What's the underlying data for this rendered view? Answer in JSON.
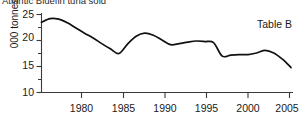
{
  "chart_data": {
    "type": "line",
    "title": "Atlantic Bluefin tuna sold",
    "xlabel": "",
    "ylabel": "000 tonnes",
    "annotation": "Table B",
    "grid": false,
    "legend": null,
    "xlim": [
      1976,
      2005
    ],
    "ylim": [
      10,
      25
    ],
    "x_ticks": [
      1980,
      1985,
      1990,
      1995,
      2000,
      2005
    ],
    "x_tick_labels": [
      "1980",
      "1985",
      "1990",
      "1995",
      "2000",
      "2005"
    ],
    "y_ticks": [
      10,
      15,
      20,
      25
    ],
    "y_tick_labels": [
      "10",
      "15",
      "20",
      "25"
    ],
    "y_minor_tick_step": 2.5,
    "line_color": "#111111",
    "series": [
      {
        "name": "Atlantic Bluefin tuna sold",
        "x": [
          1976,
          1977,
          1978,
          1979,
          1980,
          1981,
          1982,
          1983,
          1984,
          1985,
          1986,
          1987,
          1988,
          1989,
          1990,
          1991,
          1992,
          1993,
          1994,
          1995,
          1996,
          1997,
          1998,
          1999,
          2000,
          2001,
          2002,
          2003,
          2004,
          2005
        ],
        "values": [
          23.5,
          24.2,
          24.1,
          23.4,
          22.4,
          21.4,
          20.5,
          19.4,
          18.4,
          17.5,
          19.3,
          20.8,
          21.4,
          21.0,
          20.1,
          19.2,
          19.4,
          19.7,
          19.9,
          19.8,
          19.6,
          17.0,
          17.2,
          17.3,
          17.3,
          17.6,
          18.1,
          17.6,
          16.4,
          14.8
        ]
      }
    ]
  },
  "axis_labels": {
    "y": [
      "25",
      "20",
      "15",
      "10"
    ],
    "x": [
      "1980",
      "1985",
      "1990",
      "1995",
      "2000",
      "2005"
    ]
  }
}
